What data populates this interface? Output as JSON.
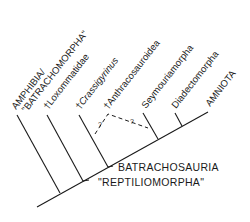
{
  "diagram": {
    "type": "cladogram",
    "taxa": [
      {
        "label_line1": "AMPHIBIA/",
        "label_line2": "\"BATRACHOMORPHA\""
      },
      {
        "label": "†Loxommatidae"
      },
      {
        "dagger": "†",
        "label": "Crassigyrinus"
      },
      {
        "label": "†Anthracosauroidea"
      },
      {
        "label": "Seymouriamorpha"
      },
      {
        "label": "Diadectomorpha"
      },
      {
        "label": "AMNIOTA"
      }
    ],
    "nodes": [
      {
        "label": "BATRACHOSAURIA"
      },
      {
        "label": "\"REPTILIOMORPHA\""
      }
    ],
    "uncertain_marks": [
      "?",
      "?"
    ]
  }
}
